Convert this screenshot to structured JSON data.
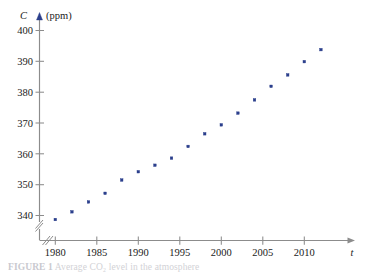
{
  "figure": {
    "caption_label": "FIGURE 1",
    "caption_text": "Average CO₂ level in the atmosphere"
  },
  "axes": {
    "y_variable": "C",
    "y_unit": "(ppm)",
    "x_variable": "t",
    "y_ticks": [
      "340",
      "350",
      "360",
      "370",
      "380",
      "390",
      "400"
    ],
    "x_ticks": [
      "1980",
      "1985",
      "1990",
      "1995",
      "2000",
      "2005",
      "2010"
    ],
    "y_break_symbol": "//",
    "x_break_symbol": "//"
  },
  "colors": {
    "marker": "#2b3f8c",
    "axis": "#8c8c8c",
    "background": "#ffffff",
    "text": "#1a1a1a"
  },
  "chart_data": {
    "type": "scatter",
    "title": "",
    "subtitle": "",
    "xlabel": "t",
    "ylabel": "C (ppm)",
    "xlim": [
      1978.2,
      2013.6
    ],
    "ylim": [
      336.5,
      402.5
    ],
    "grid": false,
    "legend": "none",
    "x_tick_values": [
      1980,
      1985,
      1990,
      1995,
      2000,
      2005,
      2010
    ],
    "y_tick_values": [
      340,
      350,
      360,
      370,
      380,
      390,
      400
    ],
    "y_axis_break": true,
    "x_axis_break": true,
    "series": [
      {
        "name": "Average CO2 level (ppm)",
        "x": [
          1980,
          1982,
          1984,
          1986,
          1988,
          1990,
          1992,
          1994,
          1996,
          1998,
          2000,
          2002,
          2004,
          2006,
          2008,
          2010,
          2012
        ],
        "y": [
          338.7,
          341.2,
          344.4,
          347.2,
          351.5,
          354.2,
          356.3,
          358.6,
          362.4,
          366.5,
          369.4,
          373.2,
          377.5,
          381.9,
          385.6,
          389.9,
          393.8
        ]
      }
    ]
  }
}
